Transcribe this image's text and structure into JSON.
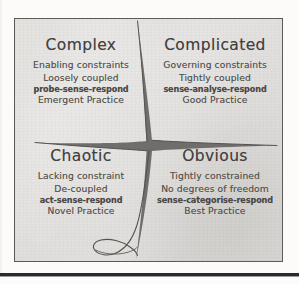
{
  "diagram": {
    "name": "Cynefin framework",
    "background_color": "#dddbd8",
    "border_color": "#5c5a58",
    "ink_color": "#57544f",
    "center_fill": "#6f6d6b",
    "quadrants": [
      {
        "id": "complex",
        "title": "Complex",
        "lines": [
          {
            "text": "Enabling constraints",
            "bold": false
          },
          {
            "text": "Loosely coupled",
            "bold": false
          },
          {
            "text": "probe-sense-respond",
            "bold": true
          },
          {
            "text": "Emergent Practice",
            "bold": false
          }
        ]
      },
      {
        "id": "complicated",
        "title": "Complicated",
        "lines": [
          {
            "text": "Governing constraints",
            "bold": false
          },
          {
            "text": "Tightly coupled",
            "bold": false
          },
          {
            "text": "sense-analyse-respond",
            "bold": true
          },
          {
            "text": "Good Practice",
            "bold": false
          }
        ]
      },
      {
        "id": "chaotic",
        "title": "Chaotic",
        "lines": [
          {
            "text": "Lacking constraint",
            "bold": false
          },
          {
            "text": "De-coupled",
            "bold": false
          },
          {
            "text": "act-sense-respond",
            "bold": true
          },
          {
            "text": "Novel Practice",
            "bold": false
          }
        ]
      },
      {
        "id": "obvious",
        "title": "Obvious",
        "lines": [
          {
            "text": "Tightly constrained",
            "bold": false
          },
          {
            "text": "No degrees of freedom",
            "bold": false
          },
          {
            "text": "sense-categorise-respond",
            "bold": true
          },
          {
            "text": "Best Practice",
            "bold": false
          }
        ]
      }
    ]
  }
}
